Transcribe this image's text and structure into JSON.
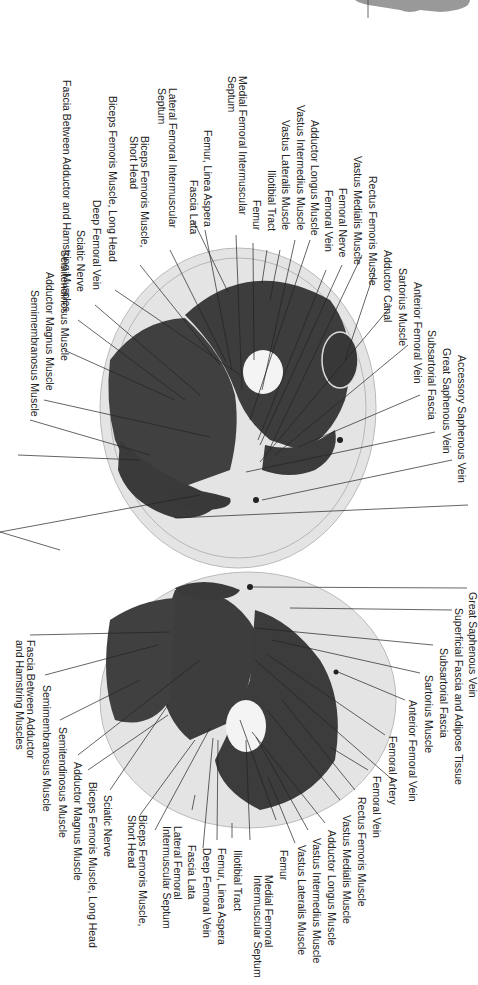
{
  "figure": {
    "type": "anatomical cross-section diagram",
    "orientation": "rotated 90 degrees clockwise",
    "colors": {
      "background": "#ffffff",
      "skin_fat": "#e6e6e6",
      "muscle": "#3f3f3f",
      "bone": "#f2f2f2",
      "line": "#222222"
    }
  },
  "upper_section": {
    "labels_left": [
      "Medial Femoral Intermuscular\nSeptum",
      "Femur, Linea Aspera",
      "Fascia Lata",
      "Lateral Femoral Intermuscular\nSeptum",
      "Biceps Femoris Muscle,\nShort Head",
      "Biceps Femoris Muscle, Long Head",
      "Deep Femoral Vein",
      "Sciatic Nerve",
      "Semitendinosus Muscle",
      "Fascia Between Adductor and Hamstring Muscles",
      "Adductor Magnus Muscle",
      "Semimembranosus Muscle"
    ],
    "labels_right": [
      "Femur",
      "Iliotibial Tract",
      "Vastus Lateralis Muscle",
      "Vastus Intermedius Muscle",
      "Adductor Longus Muscle",
      "Femoral Vein",
      "Femoral Nerve",
      "Vastus Medialis Muscle",
      "Rectus Femoris Muscle",
      "Adductor Canal",
      "Sartorius Muscle",
      "Anterior Femoral Vein",
      "Subsartorial Fascia",
      "Great Saphenous Vein",
      "Accessory Saphenous Vein"
    ]
  },
  "lower_section": {
    "labels_right": [
      "Great Saphenous Vein",
      "Superficial Fascia and Adipose Tissue",
      "Subsartorial Fascia",
      "Sartorius Muscle",
      "Anterior Femoral Vein",
      "Femoral Artery",
      "Femoral Vein",
      "Rectus Femoris Muscle",
      "Vastus Medialis Muscle",
      "Adductor Longus Muscle",
      "Vastus Intermedius Muscle",
      "Vastus Lateralis Muscle",
      "Femur",
      "Medial Femoral\nIntermuscular Septum",
      "Iliotibial Tract"
    ],
    "labels_left": [
      "Fascia Between Adductor\nand Hamstring Muscles",
      "Semimembranosus Muscle",
      "Semitendinosus Muscle",
      "Adductor Magnus Muscle",
      "Biceps Femoris Muscle, Long Head",
      "Sciatic Nerve",
      "Biceps Femoris Muscle,\nShort Head",
      "Lateral Femoral\nIntermuscular Septum",
      "Fascia Lata",
      "Deep Femoral Vein",
      "Femur, Linea Aspera"
    ]
  }
}
